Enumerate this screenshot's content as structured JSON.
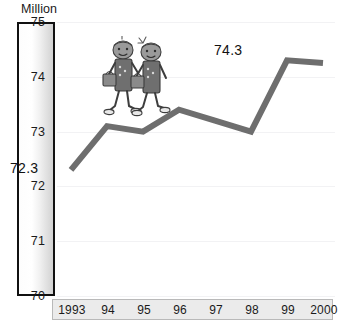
{
  "chart_data": {
    "type": "line",
    "title": "",
    "unit_caption": "Million",
    "xlabel": "",
    "ylabel": "Million",
    "ylim": [
      70,
      75
    ],
    "grid": true,
    "legend": false,
    "categories": [
      "1993",
      "94",
      "95",
      "96",
      "97",
      "98",
      "99",
      "2000"
    ],
    "x_tick_labels": [
      "1993",
      "94",
      "95",
      "96",
      "97",
      "98",
      "99",
      "2000"
    ],
    "y_tick_labels": [
      "75",
      "74",
      "73",
      "72",
      "71",
      "70"
    ],
    "y_ticks": [
      75,
      74,
      73,
      72,
      71,
      70
    ],
    "values": [
      72.3,
      73.1,
      73.0,
      73.4,
      73.2,
      73.0,
      74.3,
      74.25
    ],
    "series": [
      {
        "name": "Population",
        "values": [
          72.3,
          73.1,
          73.0,
          73.4,
          73.2,
          73.0,
          74.3,
          74.25
        ]
      }
    ],
    "annotations": [
      {
        "name": "start-value",
        "text": "72.3",
        "category": "1993",
        "value": 72.3
      },
      {
        "name": "end-value",
        "text": "74.3",
        "category": "2000",
        "value": 74.3
      }
    ],
    "colors": {
      "line": "#6e6e6e",
      "gridline": "#f2f2f4",
      "axis_border": "#111111",
      "x_band_fill": "#ebebeb",
      "x_band_border": "#b9b9b9",
      "text": "#1a1a1a",
      "illustration_fill": "#7a7a7a"
    }
  },
  "illustration": {
    "name": "two-schoolchildren-walking",
    "description": "two cartoon children with satchels walking along the line"
  }
}
